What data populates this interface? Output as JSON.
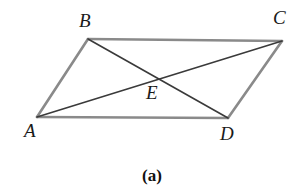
{
  "figure": {
    "caption": "(a)",
    "background_color": "#ffffff",
    "side_color": "#8a8a8a",
    "diagonal_color": "#3a3a3a",
    "side_width": 2.6,
    "diagonal_width": 1.6,
    "shape": "parallelogram with diagonals",
    "vertices": [
      {
        "name": "A",
        "label": "A",
        "x": 37,
        "y": 117,
        "label_x": 24,
        "label_y": 121
      },
      {
        "name": "B",
        "label": "B",
        "x": 88,
        "y": 39,
        "label_x": 79,
        "label_y": 11
      },
      {
        "name": "C",
        "label": "C",
        "x": 282,
        "y": 41,
        "label_x": 273,
        "label_y": 8
      },
      {
        "name": "D",
        "label": "D",
        "x": 228,
        "y": 118,
        "label_x": 220,
        "label_y": 124
      },
      {
        "name": "E",
        "label": "E",
        "x": 155,
        "y": 79,
        "label_x": 146,
        "label_y": 83
      }
    ],
    "sides": [
      {
        "name": "side-AB",
        "from": "A",
        "to": "B"
      },
      {
        "name": "side-BC",
        "from": "B",
        "to": "C"
      },
      {
        "name": "side-CD",
        "from": "C",
        "to": "D"
      },
      {
        "name": "side-DA",
        "from": "D",
        "to": "A"
      }
    ],
    "diagonals": [
      {
        "name": "diagonal-AC",
        "from": "A",
        "to": "C"
      },
      {
        "name": "diagonal-BD",
        "from": "B",
        "to": "D"
      }
    ],
    "intersection_point": "E"
  }
}
